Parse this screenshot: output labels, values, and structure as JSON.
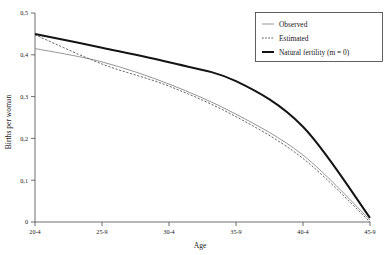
{
  "chart_data": {
    "type": "line",
    "title": "",
    "xlabel": "Age",
    "ylabel": "Births per woman",
    "categories": [
      "20-4",
      "25-9",
      "30-4",
      "35-9",
      "40-4",
      "45-9"
    ],
    "x_tick_labels": [
      "20-4",
      "25-9",
      "30-4",
      "35-9",
      "40-4",
      "45-9"
    ],
    "y_tick_labels": [
      "0",
      "0,1",
      "0,2",
      "0,3",
      "0,4",
      "0,5"
    ],
    "y_tick_values": [
      0,
      0.1,
      0.2,
      0.3,
      0.4,
      0.5
    ],
    "ylim": [
      0,
      0.5
    ],
    "xlim": [
      0,
      5
    ],
    "grid": false,
    "legend_position": "top-right",
    "series": [
      {
        "name": "Observed",
        "style": "thin-solid",
        "color": "#8a8a8a",
        "values": [
          0.415,
          0.383,
          0.33,
          0.258,
          0.16,
          0.005
        ]
      },
      {
        "name": "Estimated",
        "style": "dotted",
        "color": "#555555",
        "values": [
          0.448,
          0.378,
          0.325,
          0.252,
          0.152,
          0.0
        ]
      },
      {
        "name": "Natural fertility (m = 0)",
        "style": "thick-solid",
        "color": "#141414",
        "values": [
          0.45,
          0.417,
          0.382,
          0.337,
          0.228,
          0.01
        ]
      }
    ]
  },
  "axes": {
    "x_title": "Age",
    "y_title": "Births per woman",
    "x_ticks": [
      "20-4",
      "25-9",
      "30-4",
      "35-9",
      "40-4",
      "45-9"
    ],
    "y_ticks": [
      "0,5",
      "0,4",
      "0,3",
      "0,2",
      "0,1",
      "0"
    ]
  },
  "legend": {
    "entries": [
      {
        "label": "Observed",
        "swatch": "thin-solid-line-swatch"
      },
      {
        "label": "Estimated",
        "swatch": "dotted-line-swatch"
      },
      {
        "label": "Natural fertility (m = 0)",
        "swatch": "thick-solid-line-swatch"
      }
    ]
  }
}
